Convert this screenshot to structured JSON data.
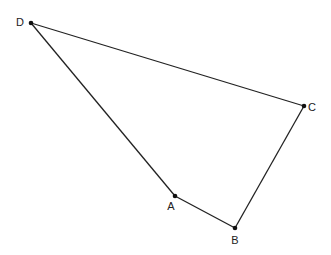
{
  "diagram": {
    "type": "quadrilateral",
    "stroke_color": "#222222",
    "point_color": "#111111",
    "points": [
      {
        "id": "A",
        "label": "A",
        "x": 175,
        "y": 196,
        "label_x": 171,
        "label_y": 210
      },
      {
        "id": "B",
        "label": "B",
        "x": 235,
        "y": 228,
        "label_x": 235,
        "label_y": 244
      },
      {
        "id": "C",
        "label": "C",
        "x": 304,
        "y": 106,
        "label_x": 312,
        "label_y": 111
      },
      {
        "id": "D",
        "label": "D",
        "x": 31,
        "y": 23,
        "label_x": 20,
        "label_y": 26
      }
    ],
    "edges": [
      {
        "from": "D",
        "to": "C"
      },
      {
        "from": "C",
        "to": "B"
      },
      {
        "from": "B",
        "to": "A"
      },
      {
        "from": "A",
        "to": "D"
      }
    ]
  }
}
